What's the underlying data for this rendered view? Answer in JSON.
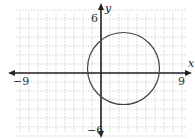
{
  "chart_data": {
    "type": "line",
    "title": "",
    "xlabel": "x",
    "ylabel": "y",
    "xlim": [
      -9,
      9
    ],
    "ylim": [
      -6,
      6
    ],
    "grid": true,
    "tick_labels": {
      "x_min": "-9",
      "x_max": "9",
      "y_max": "6",
      "y_min": "-6"
    },
    "shapes": [
      {
        "kind": "circle",
        "center": [
          2.5,
          0.5
        ],
        "radius": 4
      }
    ]
  },
  "labels": {
    "x_axis": "x",
    "y_axis": "y",
    "x_min": "−9",
    "x_max": "9",
    "y_max": "6",
    "y_min": "−6"
  },
  "colors": {
    "grid": "#bbbbbb",
    "axis": "#222222",
    "curve": "#444444"
  }
}
